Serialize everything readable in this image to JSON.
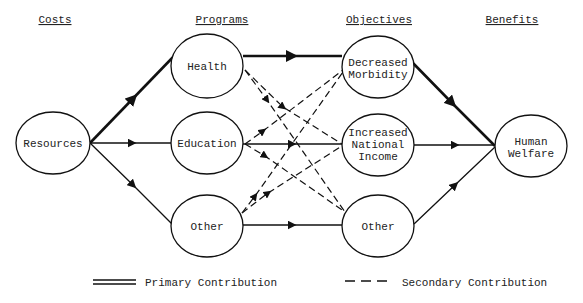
{
  "headers": {
    "costs": "Costs",
    "programs": "Programs",
    "objectives": "Objectives",
    "benefits": "Benefits"
  },
  "nodes": {
    "resources": "Resources",
    "health": "Health",
    "education": "Education",
    "other_program": "Other",
    "decreased_morbidity": [
      "Decreased",
      "Morbidity"
    ],
    "increased_national_income": [
      "Increased",
      "National",
      "Income"
    ],
    "other_objective": "Other",
    "human_welfare": [
      "Human",
      "Welfare"
    ]
  },
  "edges": {
    "primary": [
      [
        "Resources",
        "Health"
      ],
      [
        "Health",
        "Decreased Morbidity"
      ],
      [
        "Decreased Morbidity",
        "Human Welfare"
      ]
    ],
    "normal": [
      [
        "Resources",
        "Education"
      ],
      [
        "Resources",
        "Other (Program)"
      ],
      [
        "Education",
        "Increased National Income"
      ],
      [
        "Other (Program)",
        "Other (Objective)"
      ],
      [
        "Increased National Income",
        "Human Welfare"
      ],
      [
        "Other (Objective)",
        "Human Welfare"
      ]
    ],
    "secondary": [
      [
        "Health",
        "Increased National Income"
      ],
      [
        "Health",
        "Other (Objective)"
      ],
      [
        "Education",
        "Decreased Morbidity"
      ],
      [
        "Education",
        "Other (Objective)"
      ],
      [
        "Other (Program)",
        "Decreased Morbidity"
      ],
      [
        "Other (Program)",
        "Increased National Income"
      ]
    ]
  },
  "legend": {
    "primary": "Primary Contribution",
    "secondary": "Secondary Contribution"
  }
}
